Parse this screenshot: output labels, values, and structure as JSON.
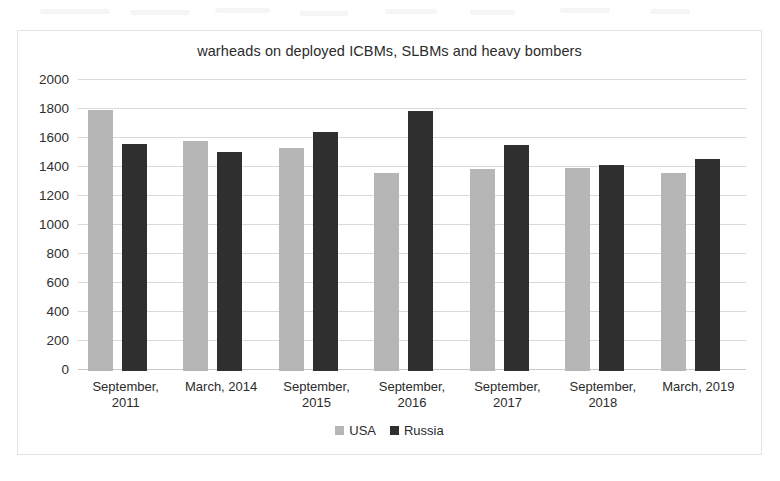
{
  "chart_data": {
    "type": "bar",
    "title": "warheads on deployed ICBMs, SLBMs and heavy bombers",
    "xlabel": "",
    "ylabel": "",
    "ylim": [
      0,
      2000
    ],
    "yticks": [
      0,
      200,
      400,
      600,
      800,
      1000,
      1200,
      1400,
      1600,
      1800,
      2000
    ],
    "grid": true,
    "legend_position": "bottom",
    "categories": [
      "September, 2011",
      "March, 2014",
      "September, 2015",
      "September, 2016",
      "September, 2017",
      "September, 2018",
      "March, 2019"
    ],
    "category_lines": [
      [
        "September,",
        "2011"
      ],
      [
        "March, 2014",
        ""
      ],
      [
        "September,",
        "2015"
      ],
      [
        "September,",
        "2016"
      ],
      [
        "September,",
        "2017"
      ],
      [
        "September,",
        "2018"
      ],
      [
        "March, 2019",
        ""
      ]
    ],
    "series": [
      {
        "name": "USA",
        "color": "#b6b6b6",
        "values": [
          1800,
          1585,
          1538,
          1367,
          1393,
          1398,
          1365
        ]
      },
      {
        "name": "Russia",
        "color": "#2f2f2f",
        "values": [
          1566,
          1512,
          1648,
          1796,
          1561,
          1420,
          1461
        ]
      }
    ]
  },
  "legend": {
    "items": [
      {
        "label": "USA",
        "color": "#b6b6b6"
      },
      {
        "label": "Russia",
        "color": "#2f2f2f"
      }
    ]
  }
}
